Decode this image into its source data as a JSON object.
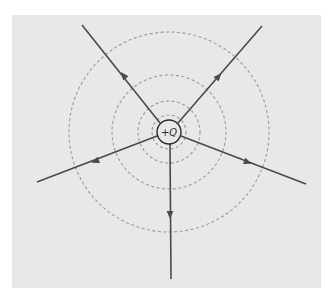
{
  "figure": {
    "type": "electric-field-diagram",
    "colors": {
      "page_background": "#ffffff",
      "panel_background": "#e8e8e8",
      "field_line": "#4a4a4a",
      "equipotential": "#9a9a9a",
      "charge_outline": "#2a2a2a",
      "charge_fill": "#e8e8e8"
    },
    "panel": {
      "x": 12,
      "y": 15,
      "width": 309,
      "height": 273
    },
    "charge": {
      "label": "+Q",
      "cx": 169,
      "cy": 132,
      "r": 12
    },
    "equipotentials": [
      {
        "r": 17
      },
      {
        "r": 31
      },
      {
        "r": 57
      },
      {
        "r": 100
      }
    ],
    "field_lines": [
      {
        "name": "upper-left",
        "x1": 160,
        "y1": 123,
        "x2": 82,
        "y2": 25,
        "arrow": {
          "x": 124,
          "y": 76,
          "direction": "outward"
        }
      },
      {
        "name": "upper-right",
        "x1": 178,
        "y1": 123,
        "x2": 262,
        "y2": 26,
        "arrow": {
          "x": 218,
          "y": 77,
          "direction": "outward"
        }
      },
      {
        "name": "left",
        "x1": 157,
        "y1": 136,
        "x2": 37,
        "y2": 182,
        "arrow": {
          "x": 96,
          "y": 161,
          "direction": "outward"
        }
      },
      {
        "name": "right",
        "x1": 181,
        "y1": 136,
        "x2": 306,
        "y2": 184,
        "arrow": {
          "x": 247,
          "y": 162,
          "direction": "outward"
        }
      },
      {
        "name": "down",
        "x1": 170,
        "y1": 144,
        "x2": 171,
        "y2": 279,
        "arrow": {
          "x": 170,
          "y": 214,
          "direction": "outward"
        }
      }
    ]
  }
}
